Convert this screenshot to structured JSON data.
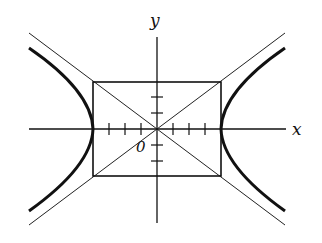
{
  "diagram": {
    "type": "hyperbola",
    "equation": "x^2/16 - y^2/9 = 1",
    "labels": {
      "x_axis": "x",
      "y_axis": "y",
      "origin": "0"
    },
    "parameters": {
      "a": 4,
      "b": 3
    },
    "elements": [
      "x-axis with unit tick marks",
      "y-axis with unit tick marks",
      "central rectangle from (-4,-3) to (4,3)",
      "asymptote y = 3x/4",
      "asymptote y = -3x/4",
      "right hyperbola branch",
      "left hyperbola branch"
    ],
    "colors": {
      "ink": "#111111",
      "background": "#ffffff"
    }
  }
}
